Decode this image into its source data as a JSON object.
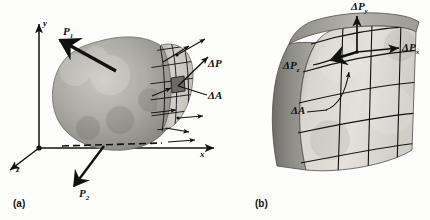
{
  "figure": {
    "background_color": "#fdfdfb",
    "ink_color": "#111111",
    "body_fill_color": "#9a9a96",
    "cut_face_color": "#cfcdc6",
    "highlight_cell_color": "#6b6a66"
  },
  "panels": [
    {
      "id": "a",
      "caption": "(a)",
      "axes": [
        {
          "name": "y-axis",
          "label": "y"
        },
        {
          "name": "x-axis",
          "label": "x"
        },
        {
          "name": "z-axis",
          "label": "z"
        }
      ],
      "forces": [
        {
          "name": "applied-force-p1",
          "label": "P",
          "sub": "1"
        },
        {
          "name": "applied-force-p2",
          "label": "P",
          "sub": "2"
        }
      ],
      "annotations": [
        {
          "name": "delta-p-label",
          "label": "ΔP",
          "sub": ""
        },
        {
          "name": "delta-a-label",
          "label": "ΔA",
          "sub": ""
        }
      ]
    },
    {
      "id": "b",
      "caption": "(b)",
      "annotations": [
        {
          "name": "delta-py-label",
          "label": "ΔP",
          "sub": "y"
        },
        {
          "name": "delta-px-label",
          "label": "ΔP",
          "sub": "x"
        },
        {
          "name": "delta-pz-label",
          "label": "ΔP",
          "sub": "z"
        },
        {
          "name": "delta-a-label",
          "label": "ΔA",
          "sub": ""
        }
      ]
    }
  ],
  "labels": {
    "axis_y": "y",
    "axis_x": "x",
    "axis_z": "z",
    "p1": "P",
    "p1_sub": "1",
    "p2": "P",
    "p2_sub": "2",
    "delta_p": "ΔP",
    "delta_a": "ΔA",
    "delta_py": "ΔP",
    "delta_py_sub": "y",
    "delta_px": "ΔP",
    "delta_px_sub": "x",
    "delta_pz": "ΔP",
    "delta_pz_sub": "z",
    "delta_a_b": "ΔA",
    "caption_a": "(a)",
    "caption_b": "(b)"
  }
}
